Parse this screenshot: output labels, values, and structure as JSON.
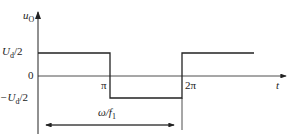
{
  "diagram": {
    "type": "square-wave-output-voltage",
    "y_axis_label": "u",
    "y_axis_sub": "O",
    "x_axis_label": "t",
    "levels": {
      "upper": {
        "label_main": "U",
        "label_sub": "d",
        "label_tail": "/2"
      },
      "zero": {
        "label": "0"
      },
      "lower": {
        "label_main": "−U",
        "label_sub": "d",
        "label_tail": "/2"
      }
    },
    "x_ticks": [
      {
        "label": "π"
      },
      {
        "label": "2π"
      }
    ],
    "period_annotation": {
      "main": "ω/f",
      "sub": "1"
    },
    "colors": {
      "line": "#222222",
      "background": "#ffffff"
    }
  }
}
